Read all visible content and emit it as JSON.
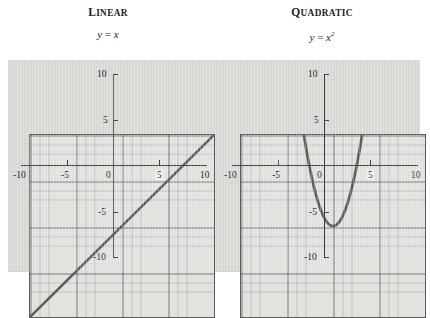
{
  "figure": {
    "background_color": "#ffffff",
    "panel_color": "#d9d9d6",
    "plot_background_color": "#e2e2df",
    "axis_color": "#3a3a38",
    "curve_color": "#5e5e5c",
    "grid_minor_color": "#787d82",
    "grid_major_color": "#5a5f64"
  },
  "panels": [
    {
      "title_cap": "L",
      "title_rest": "INEAR",
      "equation_lhs": "y",
      "equation_eq": "=",
      "equation_rhs": "x",
      "equation_exp": ""
    },
    {
      "title_cap": "Q",
      "title_rest": "UADRATIC",
      "equation_lhs": "y",
      "equation_eq": "=",
      "equation_rhs": "x",
      "equation_exp": "2"
    }
  ],
  "axis_labels": {
    "x": [
      "-10",
      "-5",
      "0",
      "5",
      "10"
    ],
    "y_left": [
      "10",
      "5",
      "-5",
      "-10"
    ],
    "y_right": [
      "10",
      "5",
      "-5",
      "-10"
    ]
  },
  "chart_data": [
    {
      "type": "line",
      "title": "LINEAR",
      "annotation": "y = x",
      "xlabel": "x",
      "ylabel": "y",
      "xlim": [
        -10,
        10
      ],
      "ylim": [
        -10,
        10
      ],
      "xticks": [
        -10,
        -5,
        0,
        5,
        10
      ],
      "yticks": [
        -10,
        -5,
        5,
        10
      ],
      "grid": true,
      "grid_minor_step": 1,
      "grid_major_step": 5,
      "legend": "none",
      "series": [
        {
          "name": "y = x",
          "x": [
            -10,
            -5,
            0,
            5,
            10
          ],
          "values": [
            -10,
            -5,
            0,
            5,
            10
          ]
        }
      ]
    },
    {
      "type": "line",
      "title": "QUADRATIC",
      "annotation": "y = x^2",
      "xlabel": "x",
      "ylabel": "y",
      "xlim": [
        -10,
        10
      ],
      "ylim": [
        -10,
        10
      ],
      "xticks": [
        -10,
        -5,
        0,
        5,
        10
      ],
      "yticks": [
        -10,
        -5,
        5,
        10
      ],
      "grid": true,
      "grid_minor_step": 1,
      "grid_major_step": 5,
      "legend": "none",
      "series": [
        {
          "name": "y = x^2",
          "x": [
            -3.1623,
            -3,
            -2.5,
            -2,
            -1.5,
            -1,
            -0.5,
            0,
            0.5,
            1,
            1.5,
            2,
            2.5,
            3,
            3.1623
          ],
          "values": [
            10,
            9,
            6.25,
            4,
            2.25,
            1,
            0.25,
            0,
            0.25,
            1,
            2.25,
            4,
            6.25,
            9,
            10
          ]
        }
      ]
    }
  ]
}
